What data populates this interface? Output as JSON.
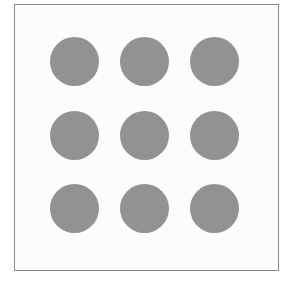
{
  "figure": {
    "page_background": "#ffffff",
    "frame": {
      "left": 14,
      "top": 4,
      "width": 265,
      "height": 267,
      "border_color": "#8a8a8a",
      "border_width": 1.5,
      "background": "#fcfcfa"
    },
    "dots": {
      "rows": 3,
      "cols": 3,
      "col_centers_x": [
        74,
        144,
        214
      ],
      "row_centers_y": [
        61,
        135,
        208
      ],
      "radius": 24.5,
      "color": "#929391"
    }
  }
}
